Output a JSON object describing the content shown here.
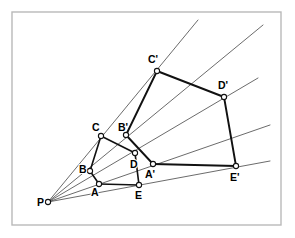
{
  "figure": {
    "frame": {
      "x": 12,
      "y": 12,
      "width": 269,
      "height": 213,
      "stroke": "#b9b9b9"
    },
    "colors": {
      "ray": "#3a3a3a",
      "edge": "#111111",
      "marker_fill": "#ffffff",
      "background": "#ffffff"
    },
    "center": {
      "name": "P",
      "label": "P",
      "x": 48,
      "y": 202,
      "label_x": 37,
      "label_y": 206
    },
    "preimage": {
      "name": "pentagon-ABCDE",
      "vertices": [
        {
          "name": "A",
          "label": "A",
          "x": 99,
          "y": 184,
          "label_x": 91,
          "label_y": 196
        },
        {
          "name": "B",
          "label": "B",
          "x": 90,
          "y": 171,
          "label_x": 79,
          "label_y": 173
        },
        {
          "name": "C",
          "label": "C",
          "x": 101,
          "y": 136,
          "label_x": 92,
          "label_y": 131
        },
        {
          "name": "D",
          "label": "D",
          "x": 135,
          "y": 153,
          "label_x": 130,
          "label_y": 168
        },
        {
          "name": "E",
          "label": "E",
          "x": 139,
          "y": 185,
          "label_x": 135,
          "label_y": 199
        }
      ],
      "edges": [
        [
          "A",
          "B"
        ],
        [
          "B",
          "C"
        ],
        [
          "C",
          "D"
        ],
        [
          "D",
          "E"
        ],
        [
          "E",
          "A"
        ]
      ]
    },
    "image": {
      "name": "pentagon-A1B1C1D1E1",
      "vertices": [
        {
          "name": "A1",
          "label": "A'",
          "x": 153,
          "y": 164,
          "label_x": 145,
          "label_y": 178
        },
        {
          "name": "B1",
          "label": "B'",
          "x": 126,
          "y": 135,
          "label_x": 118,
          "label_y": 131
        },
        {
          "name": "C1",
          "label": "C'",
          "x": 157,
          "y": 71,
          "label_x": 148,
          "label_y": 63
        },
        {
          "name": "D1",
          "label": "D'",
          "x": 224,
          "y": 97,
          "label_x": 218,
          "label_y": 89
        },
        {
          "name": "E1",
          "label": "E'",
          "x": 236,
          "y": 166,
          "label_x": 230,
          "label_y": 181
        }
      ],
      "edges": [
        [
          "A1",
          "B1"
        ],
        [
          "B1",
          "C1"
        ],
        [
          "C1",
          "D1"
        ],
        [
          "D1",
          "E1"
        ],
        [
          "E1",
          "A1"
        ]
      ]
    },
    "rays": [
      {
        "name": "ray-P-A-A1",
        "from": "P",
        "through": [
          "A",
          "A1"
        ],
        "end_x": 270,
        "end_y": 125
      },
      {
        "name": "ray-P-B-B1",
        "from": "P",
        "through": [
          "B",
          "B1"
        ],
        "end_x": 263,
        "end_y": 25
      },
      {
        "name": "ray-P-C-C1",
        "from": "P",
        "through": [
          "C",
          "C1"
        ],
        "end_x": 198,
        "end_y": 20
      },
      {
        "name": "ray-P-D-D1",
        "from": "P",
        "through": [
          "D",
          "D1"
        ],
        "end_x": 258,
        "end_y": 78
      },
      {
        "name": "ray-P-E-E1",
        "from": "P",
        "through": [
          "E",
          "E1"
        ],
        "end_x": 270,
        "end_y": 161
      }
    ]
  }
}
